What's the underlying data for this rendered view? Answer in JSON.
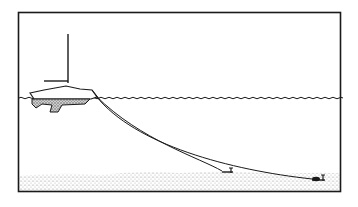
{
  "illustration": {
    "subject": "sailboat anchored with two anchor rodes to seabed",
    "colors": {
      "ink": "#1a1a1a",
      "background": "#ffffff",
      "seabed": "#c8c8c8",
      "hull_fill": "#9a9a9a"
    },
    "elements": [
      "frame",
      "mast",
      "boom",
      "hull",
      "keel",
      "waterline",
      "rode-1",
      "rode-2",
      "anchor-1",
      "anchor-2",
      "seabed"
    ]
  }
}
